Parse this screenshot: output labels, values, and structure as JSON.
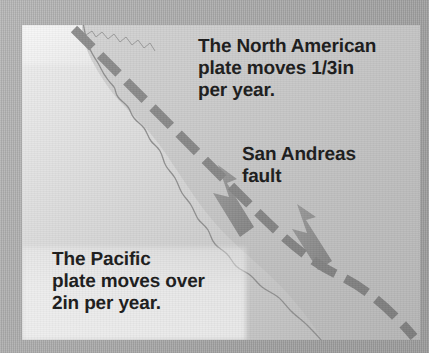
{
  "figure": {
    "media": "grayscale printed map",
    "background_color": "#d6d6d6",
    "border_color": "#a8a8a8",
    "land_color": "#c4c4c4",
    "fault_color": "#8a8a8a",
    "arrow_color": "#8e8e8e",
    "text_color": "#1b1b1b"
  },
  "labels": {
    "north_american_plate": "The North American\nplate moves 1/3in\nper year.",
    "san_andreas_fault": "San Andreas\nfault",
    "pacific_plate": "The Pacific\nplate moves over\n2in per year."
  },
  "map": {
    "landmass_name": "California and Baja California coastline",
    "fault_line_name": "San Andreas fault",
    "fault_line_style": "thick dashed line, northwest to southeast",
    "arrows": [
      {
        "name": "pacific-plate-motion-arrow",
        "direction": "northwest",
        "side": "west of fault"
      },
      {
        "name": "north-american-plate-motion-arrow",
        "direction": "northwest",
        "side": "east of fault"
      }
    ]
  }
}
